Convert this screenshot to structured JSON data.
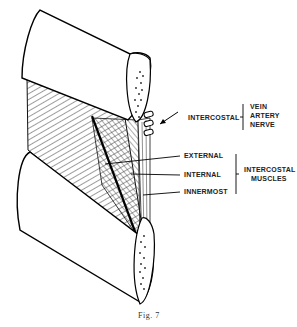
{
  "figure": {
    "caption": "Fig. 7",
    "labels": {
      "intercostal": "INTERCOSTAL",
      "vessels": [
        "VEIN",
        "ARTERY",
        "NERVE"
      ],
      "external": "EXTERNAL",
      "internal": "INTERNAL",
      "innermost": "INNERMOST",
      "muscles_group": [
        "INTERCOSTAL",
        "MUSCLES"
      ]
    }
  }
}
